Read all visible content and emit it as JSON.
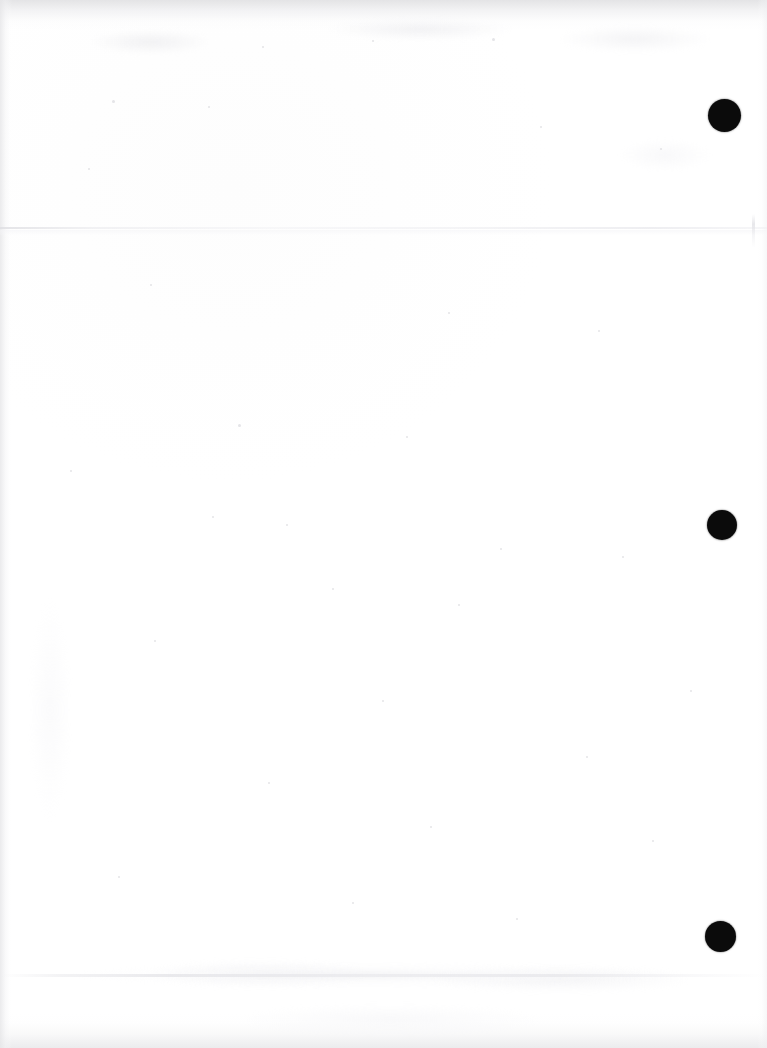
{
  "document": {
    "type": "scanned-page",
    "orientation": "portrait",
    "page_width_px": 767,
    "page_height_px": 1048,
    "content_state": "blank",
    "visible_text": "",
    "paper_color": "#ffffff",
    "ink_color": "#0b0b0b"
  },
  "marks": {
    "label": "punch-holes",
    "count": 3,
    "color": "#0b0b0b",
    "shape": "circle",
    "items": [
      {
        "name": "punch-mark-top",
        "cx": 724,
        "cy": 115,
        "d": 33
      },
      {
        "name": "punch-mark-middle",
        "cx": 722,
        "cy": 525,
        "d": 30
      },
      {
        "name": "punch-mark-bottom",
        "cx": 720,
        "cy": 936,
        "d": 31
      }
    ]
  },
  "artifacts": {
    "scan_line_upper_y": 228,
    "scan_line_lower_y": 975,
    "edge_shading": [
      "top",
      "bottom",
      "left",
      "right"
    ],
    "edge_shade_color": "#e8e8ea"
  },
  "speckles": [
    {
      "x": 112,
      "y": 100,
      "s": 3
    },
    {
      "x": 262,
      "y": 46,
      "s": 2
    },
    {
      "x": 372,
      "y": 40,
      "s": 2
    },
    {
      "x": 492,
      "y": 38,
      "s": 3
    },
    {
      "x": 660,
      "y": 148,
      "s": 2
    },
    {
      "x": 208,
      "y": 106,
      "s": 2
    },
    {
      "x": 88,
      "y": 168,
      "s": 2
    },
    {
      "x": 540,
      "y": 126,
      "s": 2
    },
    {
      "x": 150,
      "y": 284,
      "s": 2
    },
    {
      "x": 448,
      "y": 312,
      "s": 2
    },
    {
      "x": 238,
      "y": 424,
      "s": 3
    },
    {
      "x": 406,
      "y": 436,
      "s": 2
    },
    {
      "x": 212,
      "y": 516,
      "s": 2
    },
    {
      "x": 286,
      "y": 524,
      "s": 2
    },
    {
      "x": 500,
      "y": 548,
      "s": 2
    },
    {
      "x": 622,
      "y": 556,
      "s": 2
    },
    {
      "x": 332,
      "y": 588,
      "s": 2
    },
    {
      "x": 458,
      "y": 604,
      "s": 2
    },
    {
      "x": 154,
      "y": 640,
      "s": 2
    },
    {
      "x": 382,
      "y": 700,
      "s": 2
    },
    {
      "x": 586,
      "y": 756,
      "s": 2
    },
    {
      "x": 268,
      "y": 782,
      "s": 2
    },
    {
      "x": 430,
      "y": 826,
      "s": 2
    },
    {
      "x": 652,
      "y": 840,
      "s": 2
    },
    {
      "x": 118,
      "y": 876,
      "s": 2
    },
    {
      "x": 352,
      "y": 902,
      "s": 2
    },
    {
      "x": 516,
      "y": 918,
      "s": 2
    },
    {
      "x": 690,
      "y": 690,
      "s": 2
    },
    {
      "x": 70,
      "y": 470,
      "s": 2
    },
    {
      "x": 598,
      "y": 330,
      "s": 2
    }
  ],
  "blotches": [
    {
      "x": 90,
      "y": 30,
      "w": 120,
      "h": 24,
      "c": "rgba(226,226,230,0.45)"
    },
    {
      "x": 330,
      "y": 18,
      "w": 180,
      "h": 22,
      "c": "rgba(224,224,229,0.42)"
    },
    {
      "x": 560,
      "y": 26,
      "w": 150,
      "h": 26,
      "c": "rgba(228,228,232,0.40)"
    },
    {
      "x": 620,
      "y": 140,
      "w": 90,
      "h": 30,
      "c": "rgba(238,238,242,0.38)"
    },
    {
      "x": 150,
      "y": 960,
      "w": 220,
      "h": 28,
      "c": "rgba(234,234,238,0.40)"
    },
    {
      "x": 430,
      "y": 966,
      "w": 260,
      "h": 26,
      "c": "rgba(232,232,236,0.42)"
    },
    {
      "x": 240,
      "y": 1005,
      "w": 300,
      "h": 30,
      "c": "rgba(236,236,240,0.35)"
    },
    {
      "x": 30,
      "y": 600,
      "w": 40,
      "h": 220,
      "c": "rgba(243,243,246,0.35)"
    }
  ]
}
